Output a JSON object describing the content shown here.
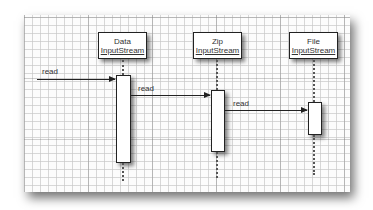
{
  "diagram": {
    "type": "sequence",
    "participants": [
      {
        "line1": "Data",
        "line2": "InputStream"
      },
      {
        "line1": "Zip",
        "line2": "InputStream"
      },
      {
        "line1": "File",
        "line2": "InputStream"
      }
    ],
    "messages": [
      {
        "label": "read",
        "from": "caller",
        "to": "DataInputStream"
      },
      {
        "label": "read",
        "from": "DataInputStream",
        "to": "ZipInputStream"
      },
      {
        "label": "read",
        "from": "ZipInputStream",
        "to": "FileInputStream"
      }
    ]
  }
}
